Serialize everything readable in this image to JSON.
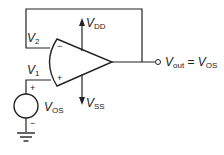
{
  "diagram": {
    "title": "",
    "type": "circuit",
    "components": {
      "opamp": {
        "inverting_input": "−",
        "noninverting_input": "+"
      },
      "voltage_source": {
        "name": "V",
        "sub": "OS",
        "plus": "+",
        "minus": "−"
      },
      "ground": "ground-symbol"
    },
    "labels": {
      "v2": {
        "main": "V",
        "sub": "2"
      },
      "v1": {
        "main": "V",
        "sub": "1"
      },
      "vdd": {
        "main": "V",
        "sub": "DD"
      },
      "vss": {
        "main": "V",
        "sub": "SS"
      },
      "vos": {
        "main": "V",
        "sub": "OS"
      },
      "vout": {
        "main": "V",
        "sub": "out",
        "eq": " = ",
        "main2": "V",
        "sub2": "OS"
      }
    },
    "signs": {
      "opamp_minus": "−",
      "opamp_plus": "+",
      "source_plus": "+",
      "source_minus": "−"
    },
    "colors": {
      "line": "#222222",
      "background": "#ffffff"
    }
  }
}
